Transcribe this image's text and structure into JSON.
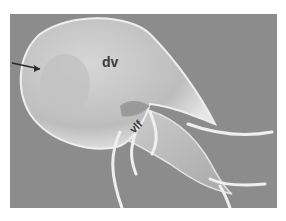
{
  "image": {
    "subject": "scanning electron micrograph of a flagellated protozoan (Giardia trophozoite)",
    "colors": {
      "background": "#8a8a8a",
      "cell_body": "#c8c8c8",
      "highlight": "#e8e8e8",
      "label": "#3a3a3a",
      "page": "#ffffff"
    }
  },
  "labels": {
    "dv": "dv",
    "vlf": "vlf"
  },
  "annotations": {
    "arrow": "arrow-pointing-to-disc"
  }
}
